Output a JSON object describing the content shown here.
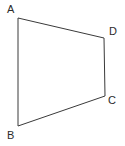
{
  "figure": {
    "name": "quadrilateral-abcd",
    "background_color": "#ffffff",
    "stroke_color": "#3a3a3a",
    "stroke_width": 1,
    "label_color": "#2b2b2b",
    "canvas": {
      "width": 125,
      "height": 146
    },
    "vertices": [
      {
        "id": "A",
        "label": "A",
        "x": 18,
        "y": 18,
        "label_x": 7,
        "label_y": 4
      },
      {
        "id": "B",
        "label": "B",
        "x": 18,
        "y": 126,
        "label_x": 7,
        "label_y": 130
      },
      {
        "id": "C",
        "label": "C",
        "x": 105,
        "y": 96,
        "label_x": 108,
        "label_y": 95
      },
      {
        "id": "D",
        "label": "D",
        "x": 104,
        "y": 38,
        "label_x": 109,
        "label_y": 26
      }
    ],
    "edges": [
      {
        "id": "AD",
        "from": "A",
        "to": "D"
      },
      {
        "id": "DC",
        "from": "D",
        "to": "C"
      },
      {
        "id": "CB",
        "from": "C",
        "to": "B"
      },
      {
        "id": "BA",
        "from": "B",
        "to": "A"
      }
    ],
    "polygon_points": "18,18 104,38 105,96 18,126"
  }
}
